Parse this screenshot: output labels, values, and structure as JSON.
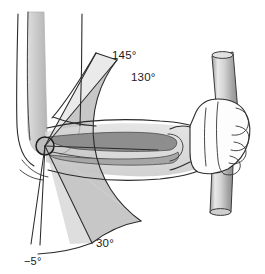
{
  "figure": {
    "view": "lateral (side) view",
    "units": "degrees",
    "background_color": "#ffffff"
  },
  "angles": [
    {
      "id": "flexion-max-passive",
      "label": "145°",
      "value": 145,
      "description": "maximum passive flexion",
      "label_x": 112,
      "label_y": 59,
      "ray_angle_deg": 145,
      "ray_length": 100,
      "drawn": true
    },
    {
      "id": "flexion-functional",
      "label": "130°",
      "value": 130,
      "description": "functional flexion arc upper limit",
      "label_x": 131,
      "label_y": 81,
      "ray_angle_deg": 130,
      "ray_length": 112,
      "drawn": true
    },
    {
      "id": "flexion-functional-low",
      "label": "30°",
      "value": 30,
      "description": "functional flexion arc lower limit",
      "label_x": 96,
      "label_y": 247,
      "ray_angle_deg": 30,
      "ray_length": 112,
      "drawn": true
    },
    {
      "id": "hyperextension",
      "label": "−5°",
      "value": -5,
      "description": "hyperextension",
      "label_x": 24,
      "label_y": 264,
      "ray_angle_deg": -5,
      "ray_length": 112,
      "drawn": true
    }
  ],
  "sectors": [
    {
      "id": "functional-arc",
      "from_deg": 30,
      "to_deg": 130,
      "fill_color": "#bfbfbf",
      "label": "functional arc 30° to 130°"
    },
    {
      "id": "total-arc",
      "from_deg": -5,
      "to_deg": 145,
      "fill_color": "#ffffff",
      "label": "total arc −5° to 145°"
    }
  ],
  "pivot": {
    "id": "elbow-joint-center",
    "x": 45,
    "y": 146,
    "radius": 9,
    "label": "elbow joint axis of rotation"
  },
  "anatomy": {
    "humerus": {
      "label": "humerus",
      "fill_color": "#c9c9c9"
    },
    "upper_arm_soft_tissue": {
      "label": "upper arm soft tissue outline",
      "fill_color": "#ffffff"
    },
    "forearm_soft_tissue": {
      "label": "forearm soft tissue outline",
      "fill_color": "#d6d6d6"
    },
    "radius_bone": {
      "label": "radius",
      "fill_color": "#8f8f8f"
    },
    "ulna_bone": {
      "label": "ulna",
      "fill_color": "#a8a8a8"
    },
    "hand": {
      "label": "hand gripping bar",
      "fill_color": "#fbfbfb"
    },
    "bar": {
      "label": "vertical cylindrical bar",
      "fill_color": "#b8b8b8",
      "highlight_color": "#e8e8e8"
    }
  },
  "colors": {
    "stroke": "#2b2b2b",
    "sector_gray": "#bfbfbf",
    "bone_dark": "#8f8f8f",
    "bone_mid": "#a8a8a8",
    "bone_light": "#c9c9c9",
    "soft_tissue": "#d6d6d6",
    "bar_gray": "#b8b8b8",
    "text": "#1a1a1a"
  }
}
